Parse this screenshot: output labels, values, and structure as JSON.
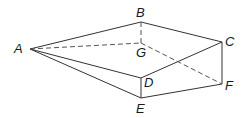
{
  "diagram": {
    "type": "3D solid (wedge/prism with apex)",
    "vertices": {
      "A": {
        "label": "A",
        "x": 30,
        "y": 49
      },
      "B": {
        "label": "B",
        "x": 141,
        "y": 22
      },
      "C": {
        "label": "C",
        "x": 222,
        "y": 42
      },
      "D": {
        "label": "D",
        "x": 141,
        "y": 78
      },
      "E": {
        "label": "E",
        "x": 141,
        "y": 98
      },
      "F": {
        "label": "F",
        "x": 222,
        "y": 84
      },
      "G": {
        "label": "G",
        "x": 141,
        "y": 43
      }
    },
    "solid_edges": [
      [
        "A",
        "B"
      ],
      [
        "B",
        "C"
      ],
      [
        "C",
        "D"
      ],
      [
        "A",
        "D"
      ],
      [
        "A",
        "E"
      ],
      [
        "D",
        "E"
      ],
      [
        "E",
        "F"
      ],
      [
        "C",
        "F"
      ]
    ],
    "hidden_edges": [
      [
        "A",
        "G"
      ],
      [
        "B",
        "G"
      ],
      [
        "G",
        "F"
      ]
    ],
    "line_color": "#333333"
  }
}
